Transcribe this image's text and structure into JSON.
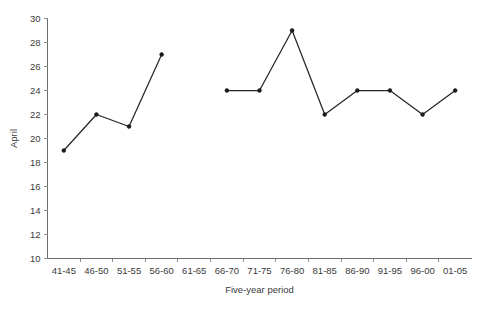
{
  "chart_data": {
    "type": "line",
    "title": "",
    "subtitle": "",
    "xlabel": "Five-year period",
    "ylabel": "April",
    "categories": [
      "41-45",
      "46-50",
      "51-55",
      "56-60",
      "61-65",
      "66-70",
      "71-75",
      "76-80",
      "81-85",
      "86-90",
      "91-95",
      "96-00",
      "01-05"
    ],
    "values": [
      19,
      22,
      21,
      27,
      null,
      24,
      24,
      29,
      22,
      24,
      24,
      22,
      24
    ],
    "ylim": [
      10,
      30
    ],
    "yticks": [
      10,
      12,
      14,
      16,
      18,
      20,
      22,
      24,
      26,
      28,
      30
    ],
    "ytick_labels": [
      "10",
      "12",
      "14",
      "16",
      "18",
      "20",
      "22",
      "24",
      "26",
      "28",
      "30"
    ],
    "grid": false,
    "legend": null,
    "line_color": "#262626",
    "marker_color": "#1a1a1a",
    "axis_color": "#6b6b6b",
    "background_color": "#ffffff"
  }
}
